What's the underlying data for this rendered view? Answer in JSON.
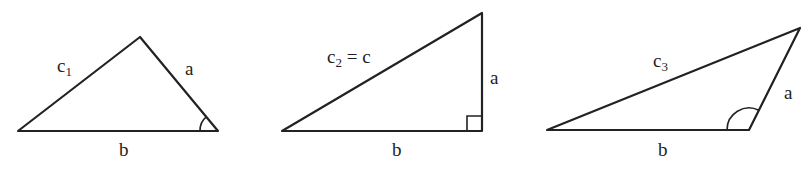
{
  "diagram": {
    "stroke_color": "#222222",
    "background": "#ffffff",
    "triangles": [
      {
        "id": "triangle-1-acute",
        "vertices": [
          [
            18,
            131
          ],
          [
            140,
            37
          ],
          [
            218,
            131
          ]
        ],
        "angle_marker": "arc",
        "labels": {
          "c_main": "c",
          "c_sub": "1",
          "c_suffix": "",
          "a": "a",
          "b": "b"
        }
      },
      {
        "id": "triangle-2-right",
        "vertices": [
          [
            282,
            131
          ],
          [
            482,
            13
          ],
          [
            482,
            131
          ]
        ],
        "angle_marker": "right-angle-square",
        "labels": {
          "c_main": "c",
          "c_sub": "2",
          "c_suffix": " = c",
          "a": "a",
          "b": "b"
        }
      },
      {
        "id": "triangle-3-obtuse",
        "vertices": [
          [
            547,
            130
          ],
          [
            800,
            28
          ],
          [
            749,
            130
          ]
        ],
        "angle_marker": "arc",
        "labels": {
          "c_main": "c",
          "c_sub": "3",
          "c_suffix": "",
          "a": "a",
          "b": "b"
        }
      }
    ]
  }
}
